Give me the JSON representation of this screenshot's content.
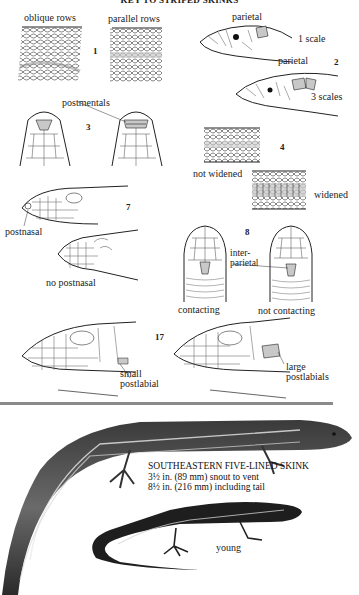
{
  "page": {
    "title": "KEY TO STRIPED SKINKS"
  },
  "key_items": [
    {
      "number": "1",
      "labels": {
        "left": "oblique rows",
        "right": "parallel rows"
      }
    },
    {
      "number": "2",
      "labels": {
        "top_part": "parietal",
        "top_count": "1 scale",
        "bottom_part": "parietal",
        "bottom_count": "3 scales"
      }
    },
    {
      "number": "3",
      "labels": {
        "feature": "postmentals"
      }
    },
    {
      "number": "4",
      "labels": {
        "left": "not widened",
        "right": "widened"
      }
    },
    {
      "number": "7",
      "labels": {
        "top": "postnasal",
        "bottom": "no postnasal"
      }
    },
    {
      "number": "8",
      "labels": {
        "feature_line1": "inter-",
        "feature_line2": "parietal",
        "left": "contacting",
        "right": "not contacting"
      }
    },
    {
      "number": "17",
      "labels": {
        "left_line1": "small",
        "left_line2": "postlabial",
        "right_line1": "large",
        "right_line2": "postlabials"
      }
    }
  ],
  "species": {
    "name": "SOUTHEASTERN FIVE-LINED SKINK",
    "size_svl": "3½ in. (89 mm) snout to vent",
    "size_total": "8½ in. (216 mm) including tail",
    "juvenile_label": "young"
  },
  "colors": {
    "highlight_scale": "#c8c8c8",
    "ink": "#1a1a1a",
    "divider": "#8a8a8a"
  }
}
